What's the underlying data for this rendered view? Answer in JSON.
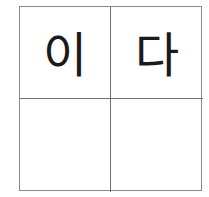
{
  "grid": {
    "cells": [
      {
        "text": "이"
      },
      {
        "text": "다"
      },
      {
        "text": ""
      },
      {
        "text": ""
      }
    ]
  }
}
